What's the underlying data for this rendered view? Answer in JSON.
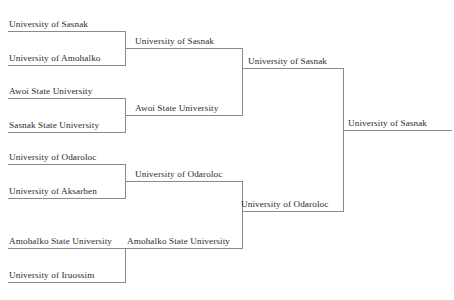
{
  "bracket": {
    "type": "single-elimination",
    "rounds": [
      {
        "name": "round-1",
        "matches": [
          {
            "slots": [
              {
                "team": "University of Sasnak"
              },
              {
                "team": "University of Amohalko"
              }
            ],
            "winner": "University of Sasnak"
          },
          {
            "slots": [
              {
                "team": "Awoi State University"
              },
              {
                "team": "Sasnak State University"
              }
            ],
            "winner": "Awoi State University"
          },
          {
            "slots": [
              {
                "team": "University of Odaroloc"
              },
              {
                "team": "University of Aksarben"
              }
            ],
            "winner": "University of Odaroloc"
          },
          {
            "slots": [
              {
                "team": "Amohalko State University"
              },
              {
                "team": "University of Iruossim"
              }
            ],
            "winner": "Amohalko State University"
          }
        ]
      },
      {
        "name": "round-2",
        "matches": [
          {
            "slots": [
              {
                "team": "University of Sasnak"
              },
              {
                "team": "Awoi State University"
              }
            ],
            "winner": "University of Sasnak"
          },
          {
            "slots": [
              {
                "team": "University of Odaroloc"
              },
              {
                "team": "Amohalko State University"
              }
            ],
            "winner": "University of Odaroloc"
          }
        ]
      },
      {
        "name": "final",
        "matches": [
          {
            "slots": [
              {
                "team": "University of Sasnak"
              },
              {
                "team": "University of Odaroloc"
              }
            ],
            "winner": "University of Sasnak"
          }
        ]
      }
    ],
    "champion": "University of Sasnak",
    "line_color": "#8a8a8a",
    "text_color": "#2b2b2b"
  }
}
